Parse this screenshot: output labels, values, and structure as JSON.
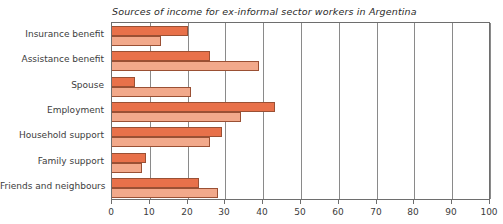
{
  "chart_data": {
    "type": "bar",
    "orientation": "horizontal",
    "title": "Sources of income for ex-informal sector workers in Argentina",
    "xlabel": "",
    "ylabel": "",
    "xlim": [
      0,
      100
    ],
    "xticks": [
      0,
      10,
      20,
      30,
      40,
      50,
      60,
      70,
      80,
      90,
      100
    ],
    "xtick_labels": [
      "0",
      "10",
      "20",
      "30",
      "40",
      "50",
      "60",
      "70",
      "80",
      "90",
      "100"
    ],
    "grid": true,
    "grid_axis": "x",
    "legend": false,
    "legend_position": "none",
    "categories": [
      "Insurance benefit",
      "Assistance benefit",
      "Spouse",
      "Employment",
      "Household support",
      "Family support",
      "Friends and neighbours"
    ],
    "series": [
      {
        "name": "series-1",
        "color": "#e8714a",
        "values": [
          20,
          26,
          6,
          43,
          29,
          9,
          23
        ]
      },
      {
        "name": "series-2",
        "color": "#f2a98b",
        "values": [
          13,
          39,
          21,
          34,
          26,
          8,
          28
        ]
      }
    ],
    "colors": {
      "series_1": "#e8714a",
      "series_2": "#f2a98b",
      "bar_border": "#9a5034",
      "axis": "#6e6e6e",
      "gridline": "#8a8a8a",
      "text": "#3c3c3c",
      "background": "#ffffff"
    }
  }
}
